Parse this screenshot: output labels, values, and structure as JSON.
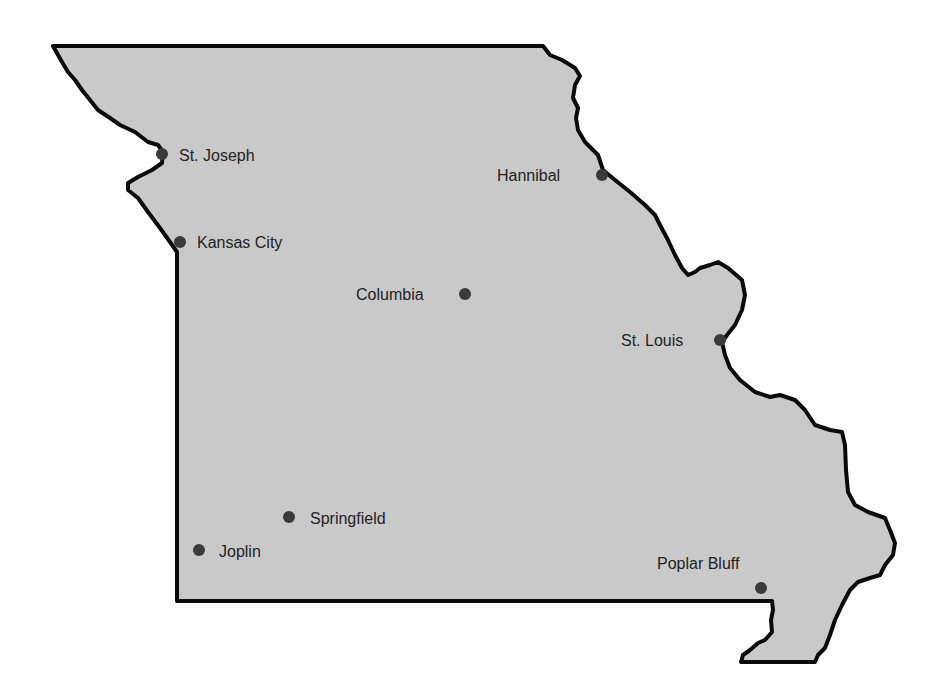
{
  "map": {
    "region": "Missouri",
    "colors": {
      "land": "#c9c9c9",
      "border": "#0a0a0a",
      "city_dot": "#3a3a3a",
      "label": "#222222",
      "background": "#ffffff"
    },
    "cities": [
      {
        "name": "St. Joseph",
        "x": 162,
        "y": 154,
        "label_side": "right"
      },
      {
        "name": "Kansas City",
        "x": 180,
        "y": 242,
        "label_side": "right"
      },
      {
        "name": "Hannibal",
        "x": 602,
        "y": 175,
        "label_side": "left"
      },
      {
        "name": "Columbia",
        "x": 465,
        "y": 294,
        "label_side": "left"
      },
      {
        "name": "St. Louis",
        "x": 720,
        "y": 340,
        "label_side": "left"
      },
      {
        "name": "Springfield",
        "x": 289,
        "y": 517,
        "label_side": "right"
      },
      {
        "name": "Joplin",
        "x": 199,
        "y": 550,
        "label_side": "right"
      },
      {
        "name": "Poplar Bluff",
        "x": 761,
        "y": 588,
        "label_side": "above-left"
      }
    ]
  }
}
